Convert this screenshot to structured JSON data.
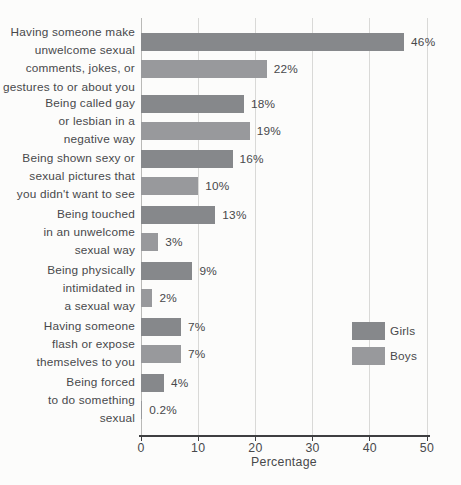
{
  "chart_data": {
    "type": "bar",
    "orientation": "horizontal",
    "title": "",
    "xlabel": "Percentage",
    "ylabel": "",
    "xlim": [
      0,
      50
    ],
    "xticks": [
      0,
      10,
      20,
      30,
      40,
      50
    ],
    "grid": true,
    "legend_position": "middle-right",
    "categories": [
      "Having someone make\nunwelcome sexual\ncomments, jokes, or\ngestures to or about you",
      "Being called gay\nor lesbian in a\nnegative way",
      "Being shown sexy or\nsexual pictures that\nyou didn't want to see",
      "Being touched\nin an unwelcome\nsexual way",
      "Being physically\nintimidated in\na sexual way",
      "Having someone\nflash or expose\nthemselves to you",
      "Being forced\nto do something\nsexual"
    ],
    "series": [
      {
        "name": "Girls",
        "color": "#86888b",
        "values": [
          46,
          18,
          16,
          13,
          9,
          7,
          4
        ],
        "labels": [
          "46%",
          "18%",
          "16%",
          "13%",
          "9%",
          "7%",
          "4%"
        ]
      },
      {
        "name": "Boys",
        "color": "#98999c",
        "values": [
          22,
          19,
          10,
          3,
          2,
          7,
          0.2
        ],
        "labels": [
          "22%",
          "19%",
          "10%",
          "3%",
          "2%",
          "7%",
          "0.2%"
        ]
      }
    ]
  },
  "colors": {
    "background": "#fcfcfb",
    "gridline": "#d9d9d7",
    "zero_line": "#b9b9b7",
    "axis_line": "#3e3f41",
    "text": "#48494b"
  }
}
